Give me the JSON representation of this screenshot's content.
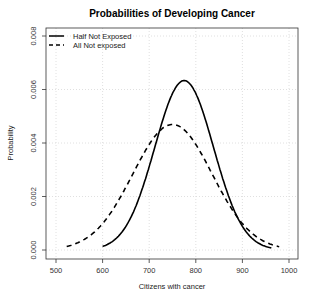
{
  "chart_data": {
    "type": "line",
    "title": "Probabilities of Developing Cancer",
    "xlabel": "Citizens with cancer",
    "ylabel": "Probability",
    "xlim": [
      490,
      1010
    ],
    "ylim": [
      -0.0003,
      0.0083
    ],
    "x_ticks": [
      500,
      600,
      700,
      800,
      900,
      1000
    ],
    "x_tick_labels": [
      "500",
      "600",
      "700",
      "800",
      "900",
      "1000"
    ],
    "y_ticks": [
      0.0,
      0.002,
      0.004,
      0.006,
      0.008
    ],
    "y_tick_labels": [
      "0.000",
      "0.002",
      "0.004",
      "0.006",
      "0.008"
    ],
    "grid": true,
    "legend_position": "top-left",
    "series": [
      {
        "name": "Half Not Exposed",
        "line_style": "solid",
        "x_range": [
          600,
          962
        ],
        "mean": 775,
        "sd": 63,
        "peak": 0.0063,
        "x": [
          600,
          625,
          650,
          675,
          700,
          725,
          750,
          775,
          800,
          825,
          850,
          875,
          900,
          925,
          950,
          962
        ],
        "values": [
          0.00014,
          0.00034,
          0.00087,
          0.00179,
          0.00311,
          0.00458,
          0.00584,
          0.00633,
          0.00584,
          0.00458,
          0.00311,
          0.00179,
          0.00087,
          0.00034,
          0.00014,
          8e-05
        ]
      },
      {
        "name": "All Not exposed",
        "line_style": "dashed",
        "x_range": [
          523,
          980
        ],
        "mean": 750,
        "sd": 85,
        "peak": 0.0047,
        "x": [
          523,
          550,
          575,
          600,
          625,
          650,
          675,
          700,
          725,
          750,
          775,
          800,
          825,
          850,
          875,
          900,
          925,
          950,
          980
        ],
        "values": [
          0.00013,
          0.00033,
          0.00056,
          0.00099,
          0.0016,
          0.00235,
          0.00317,
          0.00395,
          0.00449,
          0.00469,
          0.00449,
          0.00395,
          0.00317,
          0.00235,
          0.0016,
          0.00099,
          0.00056,
          0.00029,
          0.00012
        ]
      }
    ]
  }
}
